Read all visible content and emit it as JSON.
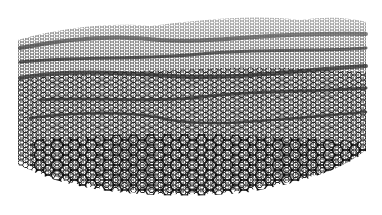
{
  "image": {
    "subject": "rippled graphene sheet",
    "description": "Perspective rendering of a hexagonal carbon lattice with wavy ripples receding into the distance",
    "colors": {
      "background": "#ffffff",
      "lattice": "#1a1a1a",
      "ripple_shadow": "#333333"
    }
  }
}
